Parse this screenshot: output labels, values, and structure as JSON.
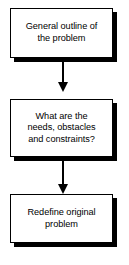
{
  "diagram": {
    "type": "flowchart",
    "orientation": "vertical",
    "colors": {
      "background": "#ffffff",
      "box_fill": "#ffffff",
      "box_border": "#000000",
      "shadow": "#000000",
      "text": "#000000",
      "arrow": "#000000"
    },
    "nodes": [
      {
        "id": "node-1",
        "label": "General outline of\nthe problem",
        "shape": "rectangle"
      },
      {
        "id": "node-2",
        "label": "What are the\nneeds, obstacles\nand constraints?",
        "shape": "rectangle"
      },
      {
        "id": "node-3",
        "label": "Redefine original\nproblem",
        "shape": "rectangle"
      }
    ],
    "connectors": [
      {
        "id": "connector-1",
        "from": "node-1",
        "to": "node-2",
        "direction": "down",
        "arrowhead": "filled-triangle"
      },
      {
        "id": "connector-2",
        "from": "node-2",
        "to": "node-3",
        "direction": "down",
        "arrowhead": "filled-triangle"
      }
    ]
  }
}
